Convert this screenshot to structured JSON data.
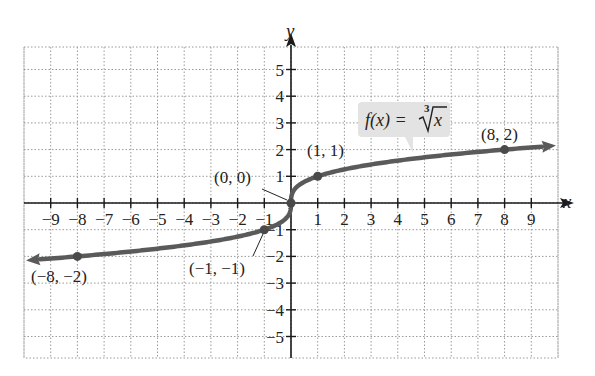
{
  "chart_data": {
    "type": "line",
    "title": "",
    "function_label": "f(x) = ∛x",
    "xlabel": "x",
    "ylabel": "y",
    "xlim": [
      -10,
      10
    ],
    "ylim": [
      -6,
      6
    ],
    "grid": true,
    "x_ticks": [
      -9,
      -8,
      -7,
      -6,
      -5,
      -4,
      -3,
      -2,
      -1,
      1,
      2,
      3,
      4,
      5,
      6,
      7,
      8,
      9
    ],
    "y_ticks": [
      -5,
      -4,
      -3,
      -2,
      -1,
      1,
      2,
      3,
      4,
      5
    ],
    "x_tick_labels": [
      "−9",
      "−8",
      "−7",
      "−6",
      "−5",
      "−4",
      "−3",
      "−2",
      "−1",
      "1",
      "2",
      "3",
      "4",
      "5",
      "6",
      "7",
      "8",
      "9"
    ],
    "y_tick_labels": [
      "−5",
      "−4",
      "−3",
      "−2",
      "−1",
      "1",
      "2",
      "3",
      "4",
      "5"
    ],
    "series": [
      {
        "name": "f(x) = ∛x",
        "color": "#555555",
        "x": [
          -9.4,
          -8,
          -1,
          0,
          1,
          8,
          9.4
        ],
        "y": [
          -2.11,
          -2,
          -1,
          0,
          1,
          2,
          2.11
        ]
      }
    ],
    "labeled_points": [
      {
        "x": -8,
        "y": -2,
        "label": "(−8, −2)"
      },
      {
        "x": -1,
        "y": -1,
        "label": "(−1, −1)"
      },
      {
        "x": 0,
        "y": 0,
        "label": "(0, 0)"
      },
      {
        "x": 1,
        "y": 1,
        "label": "(1, 1)"
      },
      {
        "x": 8,
        "y": 2,
        "label": "(8, 2)"
      }
    ]
  },
  "labels": {
    "x_axis": "x",
    "y_axis": "y",
    "function": "f(x) = ",
    "function_root_index": "3",
    "function_radicand": "x",
    "points": {
      "p_neg8": "(−8, −2)",
      "p_neg1": "(−1, −1)",
      "p_0": "(0, 0)",
      "p_1": "(1, 1)",
      "p_8": "(8, 2)"
    }
  },
  "colors": {
    "curve": "#5a5a5a",
    "axis": "#1a1a1a",
    "grid": "#9a9a9a",
    "callout_bg": "#e3e3e3"
  }
}
